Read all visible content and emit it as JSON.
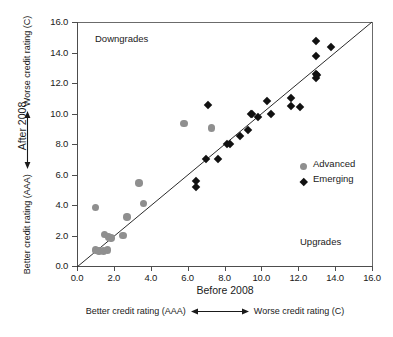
{
  "chart_data": {
    "type": "scatter",
    "title": "",
    "xlabel": "Before 2008",
    "ylabel": "After 2008",
    "xlabel_sub_left": "Better credit rating (AAA)",
    "xlabel_sub_right": "Worse credit rating (C)",
    "ylabel_sub_bottom": "Better credit rating (AAA)",
    "ylabel_sub_top": "Worse credit rating (C)",
    "xlim": [
      0.0,
      16.0
    ],
    "ylim": [
      0.0,
      16.0
    ],
    "xticks": [
      "0.0",
      "2.0",
      "4.0",
      "6.0",
      "8.0",
      "10.0",
      "12.0",
      "14.0",
      "16.0"
    ],
    "yticks": [
      "0.0",
      "2.0",
      "4.0",
      "6.0",
      "8.0",
      "10.0",
      "12.0",
      "14.0",
      "16.0"
    ],
    "xtick_values": [
      0,
      2,
      4,
      6,
      8,
      10,
      12,
      14,
      16
    ],
    "ytick_values": [
      0,
      2,
      4,
      6,
      8,
      10,
      12,
      14,
      16
    ],
    "grid": false,
    "legend_position": "inside-right",
    "reference_line": {
      "type": "identity",
      "from": [
        0,
        0
      ],
      "to": [
        16,
        16
      ]
    },
    "annotations": [
      {
        "text": "Downgrades",
        "x": 1.0,
        "y": 15.1,
        "region": "upper-left"
      },
      {
        "text": "Upgrades",
        "x": 12.1,
        "y": 2.0,
        "region": "lower-right"
      }
    ],
    "series": [
      {
        "name": "Advanced",
        "marker": "circle",
        "color": "#8f8f8f",
        "points": [
          [
            1.0,
            3.85
          ],
          [
            1.0,
            1.05
          ],
          [
            1.2,
            1.0
          ],
          [
            1.45,
            1.0
          ],
          [
            1.5,
            2.05
          ],
          [
            1.65,
            1.05
          ],
          [
            1.7,
            1.9
          ],
          [
            1.85,
            1.85
          ],
          [
            2.5,
            2.0
          ],
          [
            2.7,
            3.2
          ],
          [
            3.35,
            5.45
          ],
          [
            3.6,
            4.1
          ],
          [
            5.8,
            9.35
          ],
          [
            7.3,
            9.05
          ]
        ]
      },
      {
        "name": "Emerging",
        "marker": "diamond",
        "color": "#111111",
        "points": [
          [
            6.45,
            5.6
          ],
          [
            6.45,
            5.15
          ],
          [
            7.0,
            7.0
          ],
          [
            7.1,
            10.55
          ],
          [
            7.65,
            7.0
          ],
          [
            8.15,
            8.0
          ],
          [
            8.3,
            8.0
          ],
          [
            8.85,
            8.55
          ],
          [
            9.3,
            8.9
          ],
          [
            9.45,
            10.0
          ],
          [
            9.5,
            9.95
          ],
          [
            9.8,
            9.8
          ],
          [
            10.3,
            10.8
          ],
          [
            10.5,
            10.0
          ],
          [
            11.6,
            11.0
          ],
          [
            11.6,
            10.5
          ],
          [
            12.1,
            10.45
          ],
          [
            12.95,
            14.75
          ],
          [
            12.95,
            13.75
          ],
          [
            12.95,
            12.6
          ],
          [
            12.95,
            12.35
          ],
          [
            13.0,
            12.5
          ],
          [
            13.8,
            14.35
          ]
        ]
      }
    ]
  },
  "legend": {
    "items": [
      {
        "label": "Advanced",
        "marker": "circle"
      },
      {
        "label": "Emerging",
        "marker": "diamond"
      }
    ]
  }
}
